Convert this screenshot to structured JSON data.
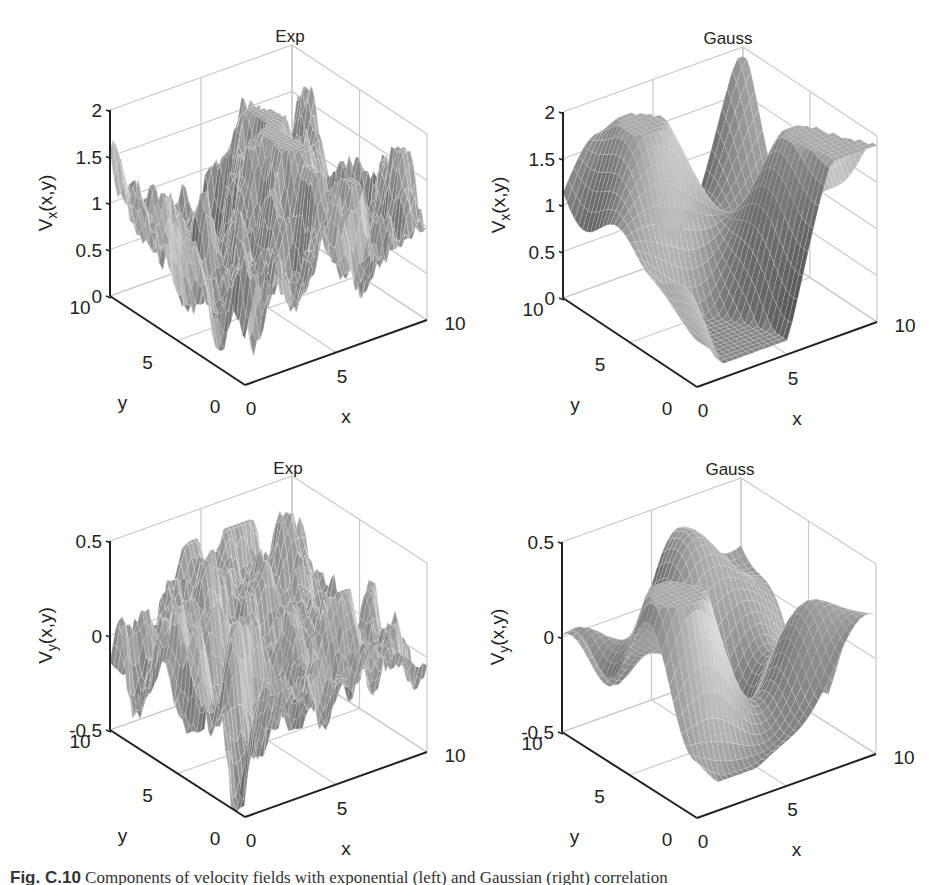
{
  "chart_data": [
    {
      "type": "surface",
      "title": "Exp",
      "xlabel": "x",
      "ylabel": "y",
      "zlabel": "V_x(x,y)",
      "xlim": [
        0,
        10
      ],
      "ylim": [
        0,
        10
      ],
      "zlim": [
        0,
        2
      ],
      "xticks": [
        "0",
        "5",
        "10"
      ],
      "yticks": [
        "0",
        "5",
        "10"
      ],
      "zticks": [
        "0",
        "0.5",
        "1",
        "1.5",
        "2"
      ],
      "grid": true,
      "surface": {
        "mean": 1.0,
        "amplitude": 0.45,
        "roughness": "high",
        "min_approx": 0.0,
        "max_approx": 1.7
      },
      "geometry": {
        "zaxis_x": 110,
        "z_top_y": 110,
        "z_bot_y": 296,
        "top_corner": [
          288,
          48
        ],
        "right_x": 426,
        "front": [
          245,
          385
        ],
        "right_bottom": [
          427,
          320
        ],
        "title_xy": [
          270,
          42
        ]
      }
    },
    {
      "type": "surface",
      "title": "Gauss",
      "xlabel": "x",
      "ylabel": "y",
      "zlabel": "V_x(x,y)",
      "xlim": [
        0,
        10
      ],
      "ylim": [
        0,
        10
      ],
      "zlim": [
        0,
        2
      ],
      "xticks": [
        "0",
        "5",
        "10"
      ],
      "yticks": [
        "0",
        "5",
        "10"
      ],
      "zticks": [
        "0",
        "0.5",
        "1",
        "1.5",
        "2"
      ],
      "grid": true,
      "surface": {
        "mean": 1.0,
        "amplitude": 0.5,
        "roughness": "smooth",
        "min_approx": 0.15,
        "max_approx": 1.9
      },
      "geometry": {
        "zaxis_x": 563,
        "z_top_y": 112,
        "z_bot_y": 298,
        "top_corner": [
          740,
          50
        ],
        "right_x": 876,
        "front": [
          697,
          387
        ],
        "right_bottom": [
          877,
          322
        ],
        "title_xy": [
          708,
          44
        ]
      }
    },
    {
      "type": "surface",
      "title": "Exp",
      "xlabel": "x",
      "ylabel": "y",
      "zlabel": "V_y(x,y)",
      "xlim": [
        0,
        10
      ],
      "ylim": [
        0,
        10
      ],
      "zlim": [
        -0.5,
        0.5
      ],
      "xticks": [
        "0",
        "5",
        "10"
      ],
      "yticks": [
        "0",
        "5",
        "10"
      ],
      "zticks": [
        "-0.5",
        "0",
        "0.5"
      ],
      "grid": true,
      "surface": {
        "mean": 0.0,
        "amplitude": 0.2,
        "roughness": "high",
        "min_approx": -0.5,
        "max_approx": 0.35
      },
      "geometry": {
        "zaxis_x": 110,
        "z_top_y": 541,
        "z_bot_y": 730,
        "top_corner": [
          287,
          478
        ],
        "right_x": 426,
        "front": [
          245,
          817
        ],
        "right_bottom": [
          427,
          752
        ],
        "title_xy": [
          268,
          474
        ]
      }
    },
    {
      "type": "surface",
      "title": "Gauss",
      "xlabel": "x",
      "ylabel": "y",
      "zlabel": "V_y(x,y)",
      "xlim": [
        0,
        10
      ],
      "ylim": [
        0,
        10
      ],
      "zlim": [
        -0.5,
        0.5
      ],
      "xticks": [
        "0",
        "5",
        "10"
      ],
      "yticks": [
        "0",
        "5",
        "10"
      ],
      "zticks": [
        "-0.5",
        "0",
        "0.5"
      ],
      "grid": true,
      "surface": {
        "mean": 0.0,
        "amplitude": 0.22,
        "roughness": "smooth",
        "min_approx": -0.35,
        "max_approx": 0.45
      },
      "geometry": {
        "zaxis_x": 562,
        "z_top_y": 542,
        "z_bot_y": 732,
        "top_corner": [
          740,
          480
        ],
        "right_x": 876,
        "front": [
          697,
          818
        ],
        "right_bottom": [
          876,
          754
        ],
        "title_xy": [
          710,
          475
        ]
      }
    }
  ],
  "caption": {
    "label": "Fig. C.10",
    "text": "Components of velocity fields with exponential (left) and Gaussian (right) correlation"
  }
}
